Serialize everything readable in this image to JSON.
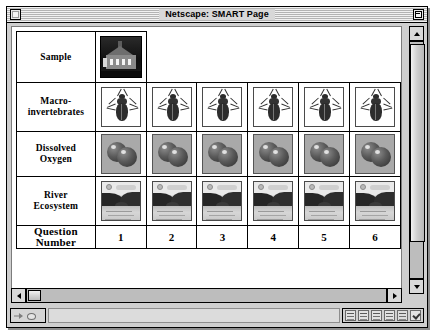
{
  "window": {
    "title": "Netscape: SMART Page",
    "close_box": "close-box",
    "zoom_box": "zoom-box"
  },
  "table": {
    "rows": [
      {
        "label": "Sample",
        "kind": "sample",
        "cells": [
          "school-building-photo"
        ]
      },
      {
        "label_line1": "Macro-",
        "label_line2": "invertebrates",
        "kind": "macro",
        "cells": [
          "beetle-image",
          "beetle-image",
          "beetle-image",
          "beetle-image",
          "beetle-image",
          "beetle-image"
        ]
      },
      {
        "label_line1": "Dissolved",
        "label_line2": "Oxygen",
        "kind": "oxygen",
        "cells": [
          "oxygen-molecule-image",
          "oxygen-molecule-image",
          "oxygen-molecule-image",
          "oxygen-molecule-image",
          "oxygen-molecule-image",
          "oxygen-molecule-image"
        ]
      },
      {
        "label_line1": "River",
        "label_line2": "Ecosystem",
        "kind": "river",
        "cells": [
          "river-landscape-image",
          "river-landscape-image",
          "river-landscape-image",
          "river-landscape-image",
          "river-landscape-image",
          "river-landscape-image"
        ]
      },
      {
        "label_line1": "Question",
        "label_line2": "Number",
        "kind": "qnum",
        "cells": [
          "1",
          "2",
          "3",
          "4",
          "5",
          "6"
        ]
      }
    ]
  },
  "statusbar": {
    "message": "",
    "icons": [
      "security-icon",
      "signature-icon",
      "mail-icon",
      "newsgroup-icon",
      "page-icon",
      "edit-icon"
    ]
  },
  "colors": {
    "window_chrome": "#cfcfcf",
    "page_background": "#ffffff",
    "title_text": "#000000",
    "scrollbar_track": "#bdbdbd",
    "scrollbar_thumb": "#d9d9d9"
  }
}
